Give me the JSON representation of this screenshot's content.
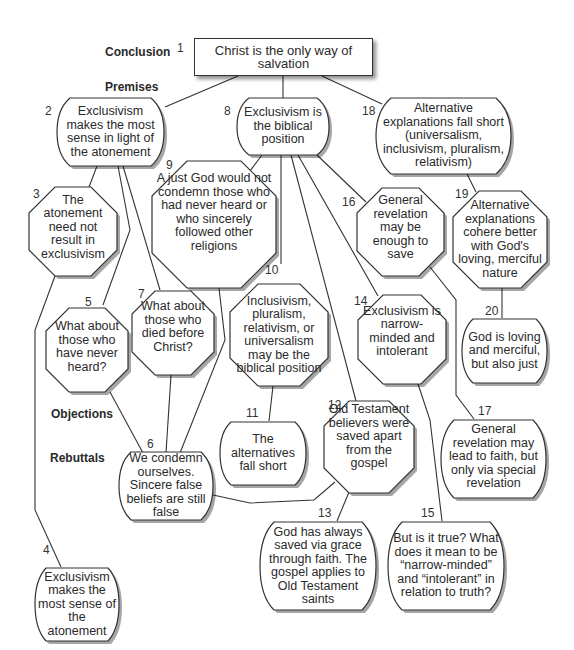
{
  "sections": {
    "conclusion": "Conclusion",
    "premises": "Premises",
    "objections": "Objections",
    "rebuttals": "Rebuttals"
  },
  "nodes": [
    {
      "id": "1",
      "type": "conclusion",
      "shape": "rectangle",
      "text": "Christ is the only way of salvation"
    },
    {
      "id": "2",
      "type": "premise",
      "shape": "rounded",
      "text": "Exclusivism makes the most sense in light of the atonement"
    },
    {
      "id": "3",
      "type": "objection",
      "shape": "octagon",
      "text": "The atonement need not result in exclusivism"
    },
    {
      "id": "4",
      "type": "rebuttal",
      "shape": "rounded",
      "text": "Exclusivism makes the most sense of the atonement"
    },
    {
      "id": "5",
      "type": "objection",
      "shape": "octagon",
      "text": "What about those who have never heard?"
    },
    {
      "id": "6",
      "type": "rebuttal",
      "shape": "rounded",
      "text": "We condemn ourselves. Sincere false beliefs are still false"
    },
    {
      "id": "7",
      "type": "objection",
      "shape": "octagon",
      "text": "What about those who died before Christ?"
    },
    {
      "id": "8",
      "type": "premise",
      "shape": "rounded",
      "text": "Exclusivism is the biblical position"
    },
    {
      "id": "9",
      "type": "objection",
      "shape": "octagon",
      "text": "A just God would not condemn those who had never heard or who sincerely followed other religions"
    },
    {
      "id": "10",
      "type": "objection",
      "shape": "octagon",
      "text": "Inclusivism, pluralism, relativism, or universalism may be the biblical position"
    },
    {
      "id": "11",
      "type": "rebuttal",
      "shape": "rounded",
      "text": "The alternatives fall short"
    },
    {
      "id": "12",
      "type": "objection",
      "shape": "octagon",
      "text": "Old Testament believers were saved apart from the gospel"
    },
    {
      "id": "13",
      "type": "rebuttal",
      "shape": "rounded",
      "text": "God has always saved via grace through faith. The gospel applies to Old Testament saints"
    },
    {
      "id": "14",
      "type": "objection",
      "shape": "octagon",
      "text": "Exclusivism is narrow-minded and intolerant"
    },
    {
      "id": "15",
      "type": "rebuttal",
      "shape": "rounded",
      "text": "But is it true? What does it mean to be “narrow-minded” and “intolerant” in relation to truth?"
    },
    {
      "id": "16",
      "type": "objection",
      "shape": "octagon",
      "text": "General revelation may be enough to save"
    },
    {
      "id": "17",
      "type": "rebuttal",
      "shape": "rounded",
      "text": "General revelation may lead to faith, but only via special revelation"
    },
    {
      "id": "18",
      "type": "premise",
      "shape": "rounded",
      "text": "Alternative explanations fall short (universalism, inclusivism, pluralism, relativism)"
    },
    {
      "id": "19",
      "type": "objection",
      "shape": "octagon",
      "text": "Alternative explanations cohere better with God's loving, merciful nature"
    },
    {
      "id": "20",
      "type": "rebuttal",
      "shape": "rounded",
      "text": "God is loving and merciful, but also just"
    }
  ],
  "edges": [
    [
      "1",
      "2"
    ],
    [
      "1",
      "8"
    ],
    [
      "1",
      "18"
    ],
    [
      "2",
      "3"
    ],
    [
      "2",
      "5"
    ],
    [
      "2",
      "7"
    ],
    [
      "3",
      "4"
    ],
    [
      "5",
      "6"
    ],
    [
      "7",
      "6"
    ],
    [
      "9",
      "6"
    ],
    [
      "8",
      "9"
    ],
    [
      "8",
      "10"
    ],
    [
      "8",
      "12"
    ],
    [
      "8",
      "14"
    ],
    [
      "8",
      "16"
    ],
    [
      "10",
      "11"
    ],
    [
      "12",
      "6"
    ],
    [
      "12",
      "13"
    ],
    [
      "14",
      "15"
    ],
    [
      "16",
      "17"
    ],
    [
      "18",
      "19"
    ],
    [
      "19",
      "20"
    ]
  ]
}
